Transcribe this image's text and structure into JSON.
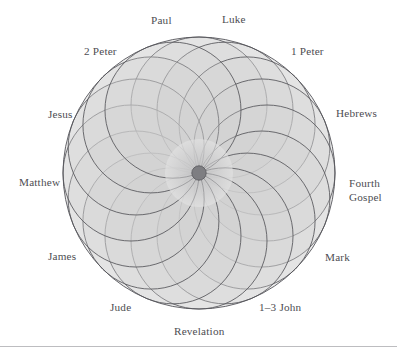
{
  "figure": {
    "title": "",
    "type": "rosette-diagram",
    "colors": {
      "background": "#ffffff",
      "stroke": "#55555a",
      "fill_light": "#e3e3e3",
      "fill_mid": "#cfcfcf",
      "center_dot": "#7e7e82",
      "label_text": "#4d4d52",
      "rule": "#bdbdc0"
    },
    "geometry": {
      "center_x": 199,
      "center_y": 173,
      "petal_radius": 68,
      "petal_count": 16,
      "outer_radius": 136,
      "center_dot_radius": 7
    },
    "labels": [
      {
        "text": "Paul",
        "x": 151,
        "y": 14,
        "align": "left"
      },
      {
        "text": "Luke",
        "x": 222,
        "y": 13,
        "align": "left"
      },
      {
        "text": "2 Peter",
        "x": 84,
        "y": 45,
        "align": "left"
      },
      {
        "text": "1 Peter",
        "x": 291,
        "y": 45,
        "align": "left"
      },
      {
        "text": "Jesus",
        "x": 48,
        "y": 108,
        "align": "left"
      },
      {
        "text": "Hebrews",
        "x": 336,
        "y": 107,
        "align": "left"
      },
      {
        "text": "Matthew",
        "x": 19,
        "y": 176,
        "align": "left"
      },
      {
        "text": "Fourth",
        "x": 349,
        "y": 177,
        "align": "left"
      },
      {
        "text": "Gospel",
        "x": 349,
        "y": 191,
        "align": "left"
      },
      {
        "text": "James",
        "x": 48,
        "y": 250,
        "align": "left"
      },
      {
        "text": "Mark",
        "x": 325,
        "y": 251,
        "align": "left"
      },
      {
        "text": "Jude",
        "x": 110,
        "y": 301,
        "align": "left"
      },
      {
        "text": "1–3 John",
        "x": 259,
        "y": 301,
        "align": "left"
      },
      {
        "text": "Revelation",
        "x": 174,
        "y": 325,
        "align": "left"
      }
    ]
  }
}
